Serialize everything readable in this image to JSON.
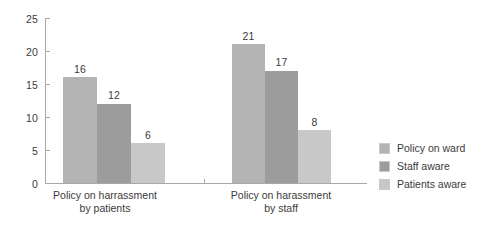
{
  "chart_data": {
    "type": "bar",
    "title": "",
    "subtitle": "",
    "xlabel": "",
    "ylabel": "",
    "ylim": [
      0,
      25
    ],
    "yticks": [
      0,
      5,
      10,
      15,
      20,
      25
    ],
    "grid": false,
    "legend_position": "right",
    "categories": [
      "Policy on harrassment by patients",
      "Policy on harassment by staff"
    ],
    "category_lines": [
      [
        "Policy on harrassment",
        "by patients"
      ],
      [
        "Policy on harassment",
        "by staff"
      ]
    ],
    "series": [
      {
        "name": "Policy on ward",
        "values": [
          16,
          21
        ],
        "color": "#b4b4b4"
      },
      {
        "name": "Staff aware",
        "values": [
          12,
          17
        ],
        "color": "#9c9c9c"
      },
      {
        "name": "Patients aware",
        "values": [
          6,
          8
        ],
        "color": "#c8c8c8"
      }
    ],
    "data_labels": [
      "16",
      "12",
      "6",
      "21",
      "17",
      "8"
    ]
  },
  "axis": {
    "y_tick_labels": [
      "0",
      "5",
      "10",
      "15",
      "20",
      "25"
    ]
  },
  "legend": {
    "items": [
      {
        "label": "Policy on ward"
      },
      {
        "label": "Staff aware"
      },
      {
        "label": "Patients aware"
      }
    ]
  },
  "bars": [
    {
      "group": 0,
      "series": 0,
      "value": 16,
      "label": "16",
      "color": "#b4b4b4",
      "left": 63,
      "width": 34
    },
    {
      "group": 0,
      "series": 1,
      "value": 12,
      "label": "12",
      "color": "#9c9c9c",
      "left": 97,
      "width": 34
    },
    {
      "group": 0,
      "series": 2,
      "value": 6,
      "label": "6",
      "color": "#c8c8c8",
      "left": 131,
      "width": 34
    },
    {
      "group": 1,
      "series": 0,
      "value": 21,
      "label": "21",
      "color": "#b4b4b4",
      "left": 232,
      "width": 33
    },
    {
      "group": 1,
      "series": 1,
      "value": 17,
      "label": "17",
      "color": "#9c9c9c",
      "left": 265,
      "width": 33
    },
    {
      "group": 1,
      "series": 2,
      "value": 8,
      "label": "8",
      "color": "#c8c8c8",
      "left": 298,
      "width": 33
    }
  ]
}
